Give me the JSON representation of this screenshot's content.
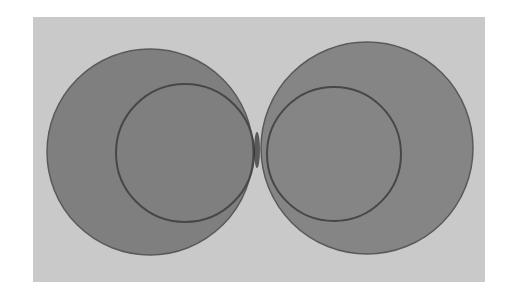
{
  "diagram": {
    "background": "#ffffff",
    "panel": {
      "x": 33,
      "y": 17,
      "width": 452,
      "height": 265,
      "color": "#c9c9c9"
    },
    "circles": [
      {
        "name": "left-outer-circle",
        "cx": 150,
        "cy": 152,
        "r": 103,
        "fill": "#7b7b7b",
        "stroke": "#5a5a5a"
      },
      {
        "name": "right-outer-circle",
        "cx": 367,
        "cy": 148,
        "r": 106,
        "fill": "#828282",
        "stroke": "#5a5a5a"
      },
      {
        "name": "left-inner-circle",
        "cx": 185,
        "cy": 153,
        "r": 69,
        "fill": "none",
        "stroke": "#474747"
      },
      {
        "name": "right-inner-circle",
        "cx": 334,
        "cy": 154,
        "r": 67,
        "fill": "none",
        "stroke": "#474747"
      }
    ],
    "contact_point": {
      "x": 257,
      "y": 150,
      "color": "#2a2a2a"
    }
  }
}
